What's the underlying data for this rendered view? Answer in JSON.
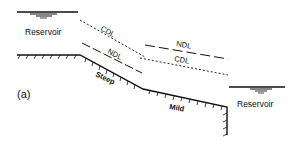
{
  "figure": {
    "panel_label": "(a)",
    "reservoirs": [
      {
        "label": "Reservoir",
        "position": "upstream-left"
      },
      {
        "label": "Reservoir",
        "position": "downstream-right"
      }
    ],
    "channel_reaches": [
      {
        "label": "Steep"
      },
      {
        "label": "Mild"
      }
    ],
    "profile_lines": [
      {
        "label": "CDL",
        "reach": "steep",
        "style": "dotted"
      },
      {
        "label": "NDL",
        "reach": "steep",
        "style": "dashed"
      },
      {
        "label": "NDL",
        "reach": "mild",
        "style": "dashed"
      },
      {
        "label": "CDL",
        "reach": "mild",
        "style": "dotted"
      }
    ],
    "colors": {
      "ink": "#111111",
      "background": "#ffffff"
    }
  }
}
